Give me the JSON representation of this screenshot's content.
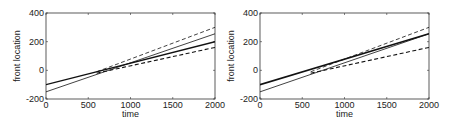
{
  "chart_data": [
    {
      "type": "line",
      "title": "",
      "xlabel": "time",
      "ylabel": "front location",
      "xlim": [
        0,
        2000
      ],
      "ylim": [
        -200,
        400
      ],
      "xticks": [
        0,
        500,
        1000,
        1500,
        2000
      ],
      "yticks": [
        -200,
        0,
        200,
        400
      ],
      "grid": false,
      "legend": null,
      "series": [
        {
          "name": "thin solid",
          "style": "solid",
          "width": 0.8,
          "x": [
            0,
            2000
          ],
          "y": [
            -150,
            255
          ]
        },
        {
          "name": "thick solid",
          "style": "solid",
          "width": 1.4,
          "x": [
            0,
            2000
          ],
          "y": [
            -100,
            200
          ]
        },
        {
          "name": "upper dashed",
          "style": "dashed",
          "width": 0.8,
          "x": [
            600,
            2000
          ],
          "y": [
            -10,
            300
          ]
        },
        {
          "name": "lower dashed",
          "style": "dashed",
          "width": 1.1,
          "x": [
            600,
            2000
          ],
          "y": [
            -20,
            160
          ]
        }
      ]
    },
    {
      "type": "line",
      "title": "",
      "xlabel": "time",
      "ylabel": "front location",
      "xlim": [
        0,
        2000
      ],
      "ylim": [
        -200,
        400
      ],
      "xticks": [
        0,
        500,
        1000,
        1500,
        2000
      ],
      "yticks": [
        -200,
        0,
        200,
        400
      ],
      "grid": false,
      "legend": null,
      "series": [
        {
          "name": "thin solid",
          "style": "solid",
          "width": 0.8,
          "x": [
            0,
            2000
          ],
          "y": [
            -150,
            255
          ]
        },
        {
          "name": "thick solid",
          "style": "solid",
          "width": 1.6,
          "x": [
            0,
            2000
          ],
          "y": [
            -100,
            255
          ]
        },
        {
          "name": "upper dashed",
          "style": "dashed",
          "width": 0.8,
          "x": [
            600,
            2000
          ],
          "y": [
            -10,
            300
          ]
        },
        {
          "name": "lower dashed",
          "style": "dashed",
          "width": 1.1,
          "x": [
            600,
            2000
          ],
          "y": [
            -20,
            160
          ]
        }
      ]
    }
  ]
}
